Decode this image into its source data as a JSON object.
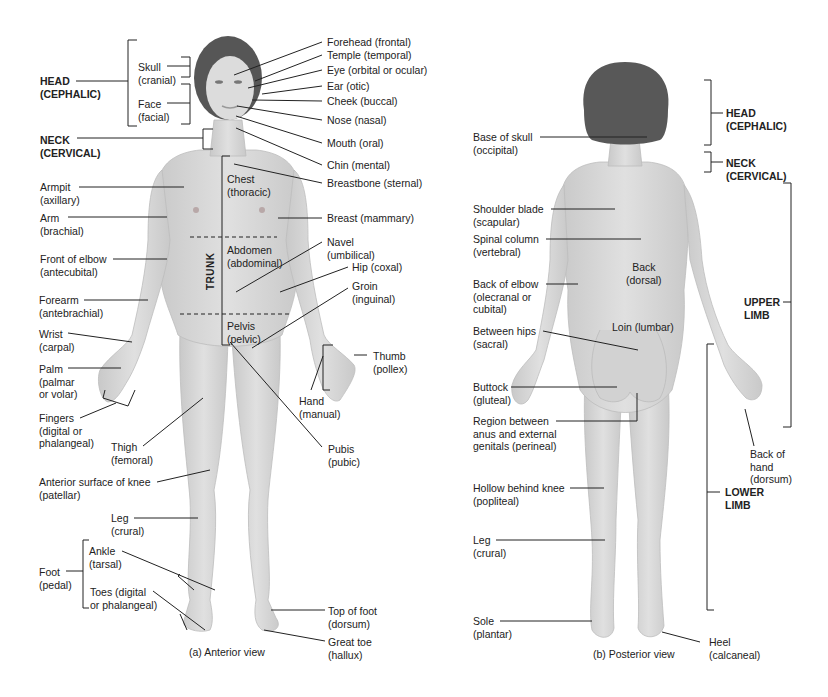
{
  "figure": {
    "colors": {
      "skin": "#d9d9d9",
      "skin_shadow": "#c4c4c4",
      "hair": "#555555",
      "line": "#222222",
      "background": "#ffffff"
    },
    "anterior": {
      "caption": "(a) Anterior view",
      "trunk_label": "TRUNK",
      "regions_bold": [
        {
          "id": "head",
          "text": "HEAD\n(CEPHALIC)"
        },
        {
          "id": "neck",
          "text": "NECK\n(CERVICAL)"
        }
      ],
      "labels": [
        {
          "id": "skull",
          "text": "Skull\n(cranial)"
        },
        {
          "id": "face",
          "text": "Face\n(facial)"
        },
        {
          "id": "forehead",
          "text": "Forehead (frontal)"
        },
        {
          "id": "temple",
          "text": "Temple (temporal)"
        },
        {
          "id": "eye",
          "text": "Eye (orbital or ocular)"
        },
        {
          "id": "ear",
          "text": "Ear (otic)"
        },
        {
          "id": "cheek",
          "text": "Cheek (buccal)"
        },
        {
          "id": "nose",
          "text": "Nose (nasal)"
        },
        {
          "id": "mouth",
          "text": "Mouth (oral)"
        },
        {
          "id": "chin",
          "text": "Chin (mental)"
        },
        {
          "id": "breastbone",
          "text": "Breastbone (sternal)"
        },
        {
          "id": "chest",
          "text": "Chest\n(thoracic)"
        },
        {
          "id": "breast",
          "text": "Breast (mammary)"
        },
        {
          "id": "abdomen",
          "text": "Abdomen\n(abdominal)"
        },
        {
          "id": "navel",
          "text": "Navel\n(umbilical)"
        },
        {
          "id": "hip",
          "text": "Hip (coxal)"
        },
        {
          "id": "groin",
          "text": "Groin\n(inguinal)"
        },
        {
          "id": "pelvis",
          "text": "Pelvis\n(pelvic)"
        },
        {
          "id": "armpit",
          "text": "Armpit\n(axillary)"
        },
        {
          "id": "arm",
          "text": "Arm\n(brachial)"
        },
        {
          "id": "front-elbow",
          "text": "Front of elbow\n(antecubital)"
        },
        {
          "id": "forearm",
          "text": "Forearm\n(antebrachial)"
        },
        {
          "id": "wrist",
          "text": "Wrist\n(carpal)"
        },
        {
          "id": "palm",
          "text": "Palm\n(palmar\nor volar)"
        },
        {
          "id": "fingers",
          "text": "Fingers\n(digital or\nphalangeal)"
        },
        {
          "id": "thumb",
          "text": "Thumb\n(pollex)"
        },
        {
          "id": "hand",
          "text": "Hand\n(manual)"
        },
        {
          "id": "thigh",
          "text": "Thigh\n(femoral)"
        },
        {
          "id": "pubis",
          "text": "Pubis\n(pubic)"
        },
        {
          "id": "knee",
          "text": "Anterior surface of knee\n(patellar)"
        },
        {
          "id": "leg-a",
          "text": "Leg\n(crural)"
        },
        {
          "id": "foot",
          "text": "Foot\n(pedal)"
        },
        {
          "id": "ankle",
          "text": "Ankle\n(tarsal)"
        },
        {
          "id": "toes",
          "text": "Toes (digital\nor phalangeal)"
        },
        {
          "id": "top-foot",
          "text": "Top of foot\n(dorsum)"
        },
        {
          "id": "great-toe",
          "text": "Great toe\n(hallux)"
        }
      ]
    },
    "posterior": {
      "caption": "(b) Posterior view",
      "regions_bold": [
        {
          "id": "head-p",
          "text": "HEAD\n(CEPHALIC)"
        },
        {
          "id": "neck-p",
          "text": "NECK\n(CERVICAL)"
        },
        {
          "id": "upper-limb",
          "text": "UPPER\nLIMB"
        },
        {
          "id": "lower-limb",
          "text": "LOWER\nLIMB"
        }
      ],
      "labels": [
        {
          "id": "base-skull",
          "text": "Base of skull\n(occipital)"
        },
        {
          "id": "shoulder-blade",
          "text": "Shoulder blade\n(scapular)"
        },
        {
          "id": "spinal-column",
          "text": "Spinal column\n(vertebral)"
        },
        {
          "id": "back",
          "text": "Back\n(dorsal)"
        },
        {
          "id": "back-elbow",
          "text": "Back of elbow\n(olecranal or\ncubital)"
        },
        {
          "id": "loin",
          "text": "Loin (lumbar)"
        },
        {
          "id": "between-hips",
          "text": "Between hips\n(sacral)"
        },
        {
          "id": "buttock",
          "text": "Buttock\n(gluteal)"
        },
        {
          "id": "perineal",
          "text": "Region between\nanus and external\ngenitals (perineal)"
        },
        {
          "id": "back-hand",
          "text": "Back of\nhand\n(dorsum)"
        },
        {
          "id": "popliteal",
          "text": "Hollow behind knee\n(popliteal)"
        },
        {
          "id": "leg-p",
          "text": "Leg\n(crural)"
        },
        {
          "id": "sole",
          "text": "Sole\n(plantar)"
        },
        {
          "id": "heel",
          "text": "Heel\n(calcaneal)"
        }
      ]
    }
  }
}
